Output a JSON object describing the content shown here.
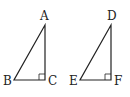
{
  "figure": {
    "stroke_color": "#222222",
    "background": "#ffffff",
    "triangles": [
      {
        "name": "ABC",
        "right_angle_at": "C",
        "vertices": {
          "A": {
            "label": "A",
            "x": 45,
            "y": 25
          },
          "B": {
            "label": "B",
            "x": 14,
            "y": 80
          },
          "C": {
            "label": "C",
            "x": 45,
            "y": 80
          }
        }
      },
      {
        "name": "DEF",
        "right_angle_at": "F",
        "vertices": {
          "D": {
            "label": "D",
            "x": 111,
            "y": 25
          },
          "E": {
            "label": "E",
            "x": 80,
            "y": 80
          },
          "F": {
            "label": "F",
            "x": 111,
            "y": 80
          }
        }
      }
    ]
  }
}
